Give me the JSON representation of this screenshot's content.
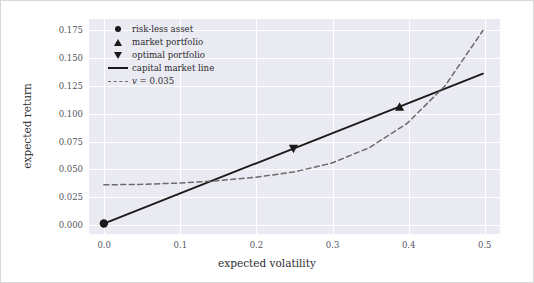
{
  "chart_data": {
    "type": "line",
    "title": "",
    "xlabel": "expected volatility",
    "ylabel": "expected return",
    "xlim": [
      -0.02,
      0.52
    ],
    "ylim": [
      -0.008,
      0.185
    ],
    "xticks": [
      "0.0",
      "0.1",
      "0.2",
      "0.3",
      "0.4",
      "0.5"
    ],
    "xtick_values": [
      0.0,
      0.1,
      0.2,
      0.3,
      0.4,
      0.5
    ],
    "yticks": [
      "0.000",
      "0.025",
      "0.050",
      "0.075",
      "0.100",
      "0.125",
      "0.150",
      "0.175"
    ],
    "ytick_values": [
      0.0,
      0.025,
      0.05,
      0.075,
      0.1,
      0.125,
      0.15,
      0.175
    ],
    "grid": true,
    "legend_position": "upper left",
    "series": [
      {
        "name": "capital market line",
        "style": "solid",
        "color": "#1a1a1a",
        "x": [
          0.0,
          0.5
        ],
        "y": [
          0.0,
          0.1355
        ]
      },
      {
        "name": "v = 0.035",
        "style": "dashed",
        "color": "#6b6b6b",
        "x": [
          0.0,
          0.05,
          0.1,
          0.15,
          0.2,
          0.25,
          0.3,
          0.35,
          0.4,
          0.45,
          0.5
        ],
        "y": [
          0.035,
          0.0354,
          0.0366,
          0.0387,
          0.0418,
          0.0465,
          0.0545,
          0.0685,
          0.0905,
          0.1245,
          0.1745
        ]
      }
    ],
    "points": [
      {
        "name": "risk-less asset",
        "marker": "circle",
        "x": 0.0,
        "y": 0.0
      },
      {
        "name": "market portfolio",
        "marker": "triangle-up",
        "x": 0.39,
        "y": 0.1055
      },
      {
        "name": "optimal portfolio",
        "marker": "triangle-down",
        "x": 0.25,
        "y": 0.0677
      }
    ],
    "legend": [
      {
        "label": "risk-less asset",
        "key": "circle-marker-icon"
      },
      {
        "label": "market portfolio",
        "key": "triangle-up-marker-icon"
      },
      {
        "label": "optimal portfolio",
        "key": "triangle-down-marker-icon"
      },
      {
        "label": "capital market line",
        "key": "solid-line-icon"
      },
      {
        "label": "v = 0.035",
        "key": "dashed-line-icon"
      }
    ],
    "colors": {
      "plot_background": "#eaeaf2",
      "figure_background": "#ffffff",
      "gridline": "#ffffff",
      "line": "#1a1a1a",
      "dashed_line": "#6b6b6b",
      "tick_label": "#55555f",
      "axis_label": "#2c2c30"
    }
  }
}
